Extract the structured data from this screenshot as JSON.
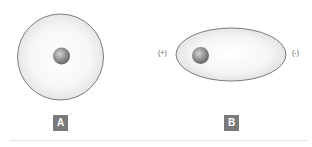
{
  "figure": {
    "panels": [
      {
        "label": "A",
        "description": "unpolarized atom: nucleus centered in spherical electron cloud",
        "cloud_shape": "circle",
        "charges": []
      },
      {
        "label": "B",
        "description": "polarized atom: electron cloud distorted into ellipse, nucleus shifted toward positive side",
        "cloud_shape": "ellipse",
        "charges": [
          {
            "side": "left",
            "text": "(+)"
          },
          {
            "side": "right",
            "text": "(-)"
          }
        ]
      }
    ]
  },
  "colors": {
    "cloud_fill": "#f2f2f2",
    "cloud_stroke": "#6e6e6e",
    "nucleus_light": "#c8c8c8",
    "nucleus_dark": "#6a6a6a",
    "label_bg": "#7a7a7a",
    "label_text": "#ffffff",
    "rule": "#e3e3e3"
  }
}
